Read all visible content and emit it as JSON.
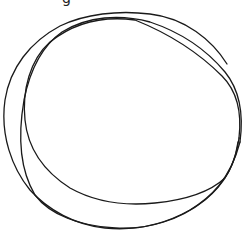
{
  "drawing": {
    "description": "hand-drawn scribbled circle",
    "stroke_color": "#1a1a1a",
    "background_color": "#ffffff",
    "stroke_width": 1.3,
    "loops": 3
  },
  "top_fragment": {
    "text": "g"
  }
}
